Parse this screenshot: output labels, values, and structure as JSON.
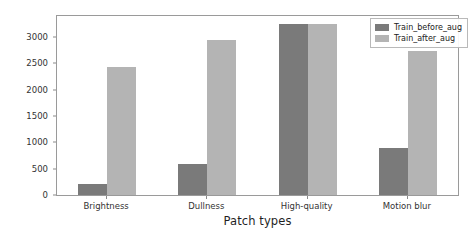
{
  "chart_data": {
    "type": "bar",
    "title": "",
    "xlabel": "Patch types",
    "ylabel": "Number of samples",
    "categories": [
      "Brightness",
      "Dullness",
      "High-quality",
      "Motion blur"
    ],
    "series": [
      {
        "name": "Train_before_aug",
        "color": "#7a7a7a",
        "values": [
          200,
          580,
          3250,
          890
        ]
      },
      {
        "name": "Train_after_aug",
        "color": "#b4b4b4",
        "values": [
          2440,
          2950,
          3250,
          2740
        ]
      }
    ],
    "ylim": [
      0,
      3400
    ],
    "yticks": [
      0,
      500,
      1000,
      1500,
      2000,
      2500,
      3000
    ],
    "ytick_labels": [
      "0",
      "500",
      "1000",
      "1500",
      "2000",
      "2500",
      "3000"
    ],
    "grid": false,
    "legend_position": "upper right"
  },
  "legend": {
    "entries": [
      {
        "label": "Train_before_aug"
      },
      {
        "label": "Train_after_aug"
      }
    ]
  },
  "axes": {
    "x_title": "Patch types",
    "y_title": "Number of samples"
  }
}
